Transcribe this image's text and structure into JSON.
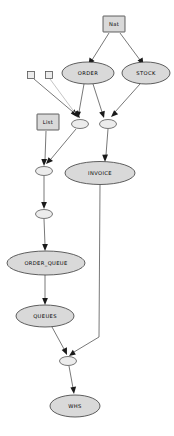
{
  "diagram": {
    "type": "directed-graph",
    "title": "",
    "background_color": "#ffffff",
    "node_fill_color": "#d9d9d9",
    "node_stroke_color": "#3a3a3a",
    "edge_color": "#555555",
    "faint_edge_color": "#bdbdbd",
    "arrow_color": "#1a1a1a",
    "nodes": [
      {
        "id": "nat",
        "label": "Nat",
        "shape": "rect",
        "cx": 114,
        "cy": 24,
        "w": 22,
        "h": 16
      },
      {
        "id": "order",
        "label": "ORDER",
        "shape": "ellipse",
        "cx": 88,
        "cy": 73,
        "w": 52,
        "h": 22
      },
      {
        "id": "stock",
        "label": "STOCK",
        "shape": "ellipse",
        "cx": 146,
        "cy": 73,
        "w": 48,
        "h": 22
      },
      {
        "id": "sq1",
        "label": "",
        "shape": "rect",
        "cx": 31,
        "cy": 75,
        "w": 7,
        "h": 7
      },
      {
        "id": "sq2",
        "label": "",
        "shape": "rect",
        "cx": 49,
        "cy": 75,
        "w": 7,
        "h": 7
      },
      {
        "id": "list",
        "label": "List",
        "shape": "rect",
        "cx": 48,
        "cy": 122,
        "w": 22,
        "h": 16
      },
      {
        "id": "join_a",
        "label": "",
        "shape": "ellipse",
        "cx": 80,
        "cy": 124,
        "w": 17,
        "h": 9
      },
      {
        "id": "join_b",
        "label": "",
        "shape": "ellipse",
        "cx": 108,
        "cy": 124,
        "w": 17,
        "h": 9
      },
      {
        "id": "invoice",
        "label": "INVOICE",
        "shape": "ellipse",
        "cx": 100,
        "cy": 173,
        "w": 70,
        "h": 23
      },
      {
        "id": "join_c",
        "label": "",
        "shape": "ellipse",
        "cx": 44,
        "cy": 171,
        "w": 17,
        "h": 9
      },
      {
        "id": "join_d",
        "label": "",
        "shape": "ellipse",
        "cx": 44,
        "cy": 214,
        "w": 17,
        "h": 9
      },
      {
        "id": "order_queue",
        "label": "ORDER_QUEUE",
        "shape": "ellipse",
        "cx": 46,
        "cy": 263,
        "w": 78,
        "h": 24
      },
      {
        "id": "queues",
        "label": "QUEUES",
        "shape": "ellipse",
        "cx": 45,
        "cy": 316,
        "w": 58,
        "h": 22
      },
      {
        "id": "join_e",
        "label": "",
        "shape": "ellipse",
        "cx": 68,
        "cy": 361,
        "w": 17,
        "h": 9
      },
      {
        "id": "whs",
        "label": "WHS",
        "shape": "ellipse",
        "cx": 75,
        "cy": 406,
        "w": 50,
        "h": 22
      }
    ],
    "edges": [
      {
        "from": "nat",
        "to": "order",
        "arrow": true,
        "style": "solid"
      },
      {
        "from": "nat",
        "to": "stock",
        "arrow": true,
        "style": "solid"
      },
      {
        "from": "order",
        "to": "join_a",
        "arrow": true,
        "style": "solid"
      },
      {
        "from": "order",
        "to": "join_b",
        "arrow": true,
        "style": "solid"
      },
      {
        "from": "stock",
        "to": "join_b",
        "arrow": true,
        "style": "solid"
      },
      {
        "from": "sq1",
        "to": "join_a",
        "arrow": true,
        "style": "solid"
      },
      {
        "from": "sq2",
        "to": "join_a",
        "arrow": true,
        "style": "faint"
      },
      {
        "from": "list",
        "to": "join_c",
        "arrow": true,
        "style": "solid"
      },
      {
        "from": "join_a",
        "to": "join_c",
        "arrow": true,
        "style": "solid"
      },
      {
        "from": "join_b",
        "to": "invoice",
        "arrow": true,
        "style": "solid"
      },
      {
        "from": "join_c",
        "to": "join_d",
        "arrow": true,
        "style": "solid"
      },
      {
        "from": "join_d",
        "to": "order_queue",
        "arrow": true,
        "style": "solid"
      },
      {
        "from": "order_queue",
        "to": "queues",
        "arrow": true,
        "style": "solid"
      },
      {
        "from": "queues",
        "to": "join_e",
        "arrow": true,
        "style": "solid"
      },
      {
        "from": "invoice",
        "to": "join_e",
        "arrow": true,
        "style": "solid"
      },
      {
        "from": "join_e",
        "to": "whs",
        "arrow": true,
        "style": "solid"
      }
    ]
  }
}
